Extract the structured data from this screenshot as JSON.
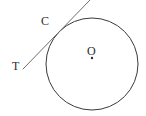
{
  "figure": {
    "type": "geometry-diagram",
    "background_color": "#ffffff",
    "stroke_color": "#3a3a3a",
    "label_color": "#2b2b2b",
    "width": 146,
    "height": 116
  },
  "labels": {
    "tangent_point": "C",
    "tangent_end": "T",
    "center": "O"
  },
  "shapes": {
    "circle": {
      "name": "main-circle",
      "cx": 92,
      "cy": 64,
      "r": 46,
      "stroke": "#3a3a3a",
      "stroke_width": 1,
      "fill": "none"
    },
    "center_dot": {
      "name": "center-point-dot",
      "cx": 92,
      "cy": 58,
      "r": 1.2,
      "fill": "#2b2b2b"
    },
    "tangent_line": {
      "name": "tangent-line",
      "x1": 23,
      "y1": 69,
      "x2": 90,
      "y2": 0,
      "stroke": "#6e6e6e",
      "stroke_width": 1
    },
    "tangent_contact": {
      "cx": 58,
      "cy": 33
    }
  }
}
